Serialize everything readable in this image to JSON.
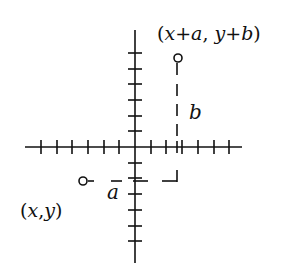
{
  "figure": {
    "colors": {
      "ink": "#111111",
      "background": "#ffffff"
    },
    "axes": {
      "origin": [
        135,
        147
      ],
      "x_axis": {
        "from": 25,
        "to": 242
      },
      "y_axis": {
        "from": 30,
        "to": 263
      },
      "tick_spacing": 15.7,
      "x_ticks_left": 6,
      "x_ticks_right": 6,
      "y_ticks_up": 6,
      "y_ticks_down": 6
    },
    "points": {
      "start": {
        "label": "(x,y)",
        "label_parts": [
          "(",
          "x",
          ",",
          "y",
          ")"
        ],
        "marker": "open-circle"
      },
      "end": {
        "label": "(x+a, y+b)",
        "label_parts": [
          "(",
          "x",
          "+",
          "a",
          ", ",
          "y",
          "+",
          "b",
          ")"
        ],
        "marker": "open-circle"
      }
    },
    "displacement_labels": {
      "horizontal": "a",
      "vertical": "b"
    }
  }
}
